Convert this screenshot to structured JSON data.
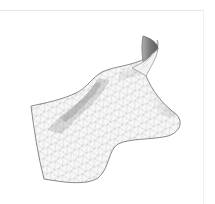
{
  "figure": {
    "colors": {
      "background": "#ffffff",
      "frame_line": "#e6e6e6",
      "surface_fill": "#fafafa",
      "mesh_line": "#b4b4b4",
      "outline": "#6e6e6e",
      "valley_shade": "#8a8a8a",
      "curl_back": "#7a7a7a"
    }
  }
}
